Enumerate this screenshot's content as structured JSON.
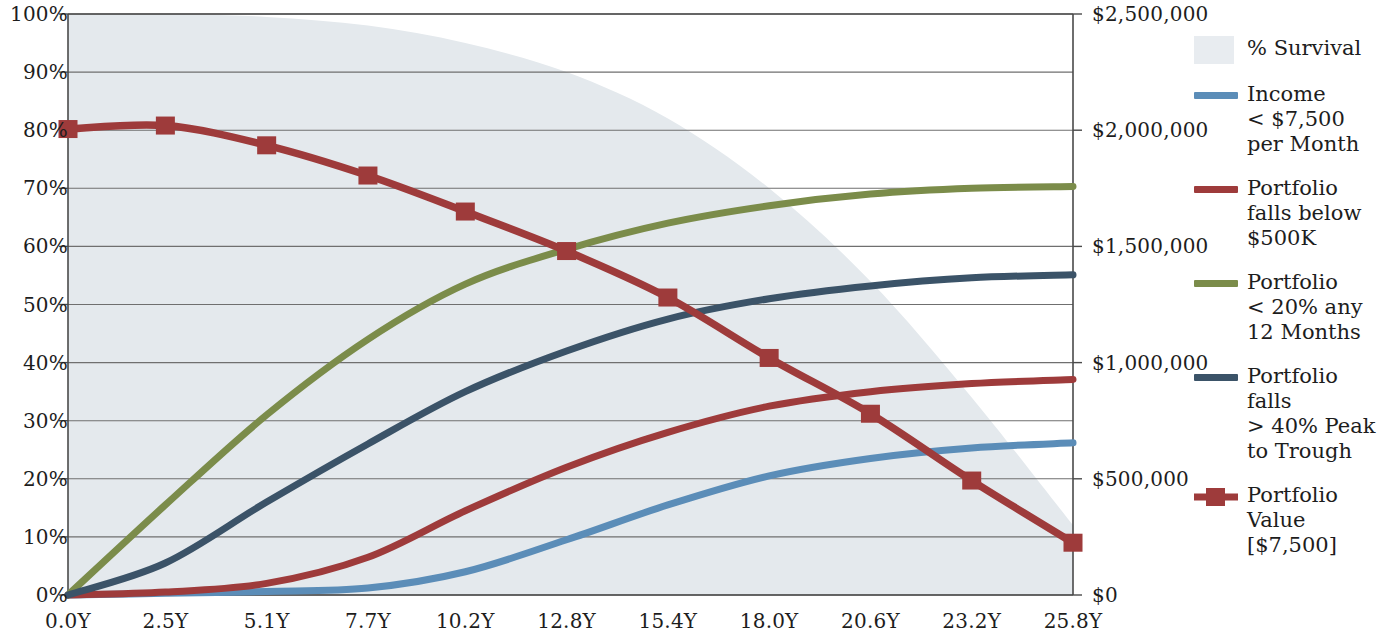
{
  "chart_data": {
    "type": "line",
    "title": "",
    "xlabel": "",
    "ylabel": "",
    "y2label": "",
    "grid": true,
    "legend_position": "right",
    "x": [
      0.0,
      2.5,
      5.1,
      7.7,
      10.2,
      12.8,
      15.4,
      18.0,
      20.6,
      23.2,
      25.8
    ],
    "categories": [
      "0.0Y",
      "2.5Y",
      "5.1Y",
      "7.7Y",
      "10.2Y",
      "12.8Y",
      "15.4Y",
      "18.0Y",
      "20.6Y",
      "23.2Y",
      "25.8Y"
    ],
    "ylim": [
      0,
      100
    ],
    "yticks": [
      0,
      10,
      20,
      30,
      40,
      50,
      60,
      70,
      80,
      90,
      100
    ],
    "ytick_labels": [
      "0%",
      "10%",
      "20%",
      "30%",
      "40%",
      "50%",
      "60%",
      "70%",
      "80%",
      "90%",
      "100%"
    ],
    "y2lim": [
      0,
      2500000
    ],
    "y2ticks": [
      0,
      500000,
      1000000,
      1500000,
      2000000,
      2500000
    ],
    "y2tick_labels": [
      "$0",
      "$500,000",
      "$1,000,000",
      "$1,500,000",
      "$2,000,000",
      "$2,500,000"
    ],
    "series": [
      {
        "name": "% Survival",
        "kind": "area",
        "axis": "left",
        "color": "#e4e9ed",
        "values": [
          100,
          100,
          99.5,
          98,
          95,
          90,
          82,
          70,
          54,
          34,
          12
        ]
      },
      {
        "name": "Income < $7,500 per Month",
        "kind": "line",
        "axis": "left",
        "color": "#5b8db8",
        "values": [
          0,
          0.3,
          0.6,
          1.2,
          4,
          9.5,
          15.5,
          20.5,
          23.5,
          25.3,
          26.2
        ]
      },
      {
        "name": "Portfolio falls below $500K",
        "kind": "line",
        "axis": "left",
        "color": "#9e3b3b",
        "values": [
          0,
          0.5,
          2,
          6.5,
          14.5,
          22,
          28,
          32.5,
          35,
          36.4,
          37.1
        ]
      },
      {
        "name": "Portfolio < 20% any 12 Months",
        "kind": "line",
        "axis": "left",
        "color": "#7b8c4a",
        "values": [
          0,
          15.5,
          31,
          44,
          53.5,
          59.5,
          64,
          67,
          69,
          70,
          70.3
        ]
      },
      {
        "name": "Portfolio falls > 40% Peak to Trough",
        "kind": "line",
        "axis": "left",
        "color": "#3b5368",
        "values": [
          0,
          5.5,
          16,
          26,
          35,
          42,
          47.5,
          51,
          53.2,
          54.6,
          55.1
        ]
      },
      {
        "name": "Portfolio Value [$7,500]",
        "kind": "line-marker",
        "axis": "right",
        "color": "#9e3b3b",
        "values": [
          80.2,
          80.8,
          77.4,
          72.2,
          66.0,
          59.2,
          51.2,
          40.8,
          31.2,
          19.7,
          9.0
        ],
        "values_dollars": [
          2005000,
          2020000,
          1935000,
          1805000,
          1650000,
          1480000,
          1280000,
          1020000,
          780000,
          492500,
          225000
        ]
      }
    ]
  },
  "axes": {
    "left_ticks": [
      "100%",
      "90%",
      "80%",
      "70%",
      "60%",
      "50%",
      "40%",
      "30%",
      "20%",
      "10%",
      "0%"
    ],
    "right_ticks": [
      "$2,500,000",
      "$2,000,000",
      "$1,500,000",
      "$1,000,000",
      "$500,000",
      "$0"
    ],
    "x_ticks": [
      "0.0Y",
      "2.5Y",
      "5.1Y",
      "7.7Y",
      "10.2Y",
      "12.8Y",
      "15.4Y",
      "18.0Y",
      "20.6Y",
      "23.2Y",
      "25.8Y"
    ]
  },
  "legend": {
    "items": [
      {
        "swatch": "area",
        "color": "#e4e9ed",
        "l1": "% Survival",
        "l2": "",
        "l3": ""
      },
      {
        "swatch": "line",
        "color": "#5b8db8",
        "l1": "Income",
        "l2": "< $7,500",
        "l3": "per Month"
      },
      {
        "swatch": "line",
        "color": "#9e3b3b",
        "l1": "Portfolio",
        "l2": "falls below",
        "l3": "$500K"
      },
      {
        "swatch": "line",
        "color": "#7b8c4a",
        "l1": "Portfolio",
        "l2": "< 20% any",
        "l3": "12 Months"
      },
      {
        "swatch": "line",
        "color": "#3b5368",
        "l1": "Portfolio falls",
        "l2": "> 40% Peak",
        "l3": "to Trough"
      },
      {
        "swatch": "line-marker",
        "color": "#9e3b3b",
        "l1": "Portfolio",
        "l2": "Value",
        "l3": "[$7,500]"
      }
    ]
  },
  "colors": {
    "survival_area": "#e4e9ed",
    "income": "#5b8db8",
    "below_500k": "#9e3b3b",
    "under_20pct": "#7b8c4a",
    "peak_to_trough": "#3b5368",
    "portfolio_value": "#9e3b3b",
    "grid": "#6b6b6b",
    "axis": "#555555",
    "background": "#ffffff"
  }
}
